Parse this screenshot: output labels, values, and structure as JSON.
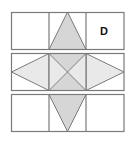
{
  "diagram": {
    "colors": {
      "line": "#7a7a7a",
      "dark_fill": "#d6d6d6",
      "light_fill": "#e9e9e9",
      "background": "#ffffff",
      "label": "#111111"
    },
    "rows": [
      {
        "name": "top-row",
        "cells": 3
      },
      {
        "name": "middle-row",
        "cells": 3
      },
      {
        "name": "bottom-row",
        "cells": 3
      }
    ],
    "label": {
      "text": "D",
      "cell": "top-right"
    }
  }
}
